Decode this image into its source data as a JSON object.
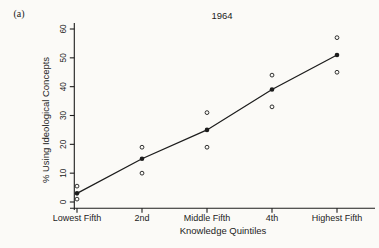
{
  "chart_data": {
    "type": "line",
    "title": "1964",
    "panel_label": "(a)",
    "xlabel": "Knowledge Quintiles",
    "ylabel": "% Using Ideological Concepts",
    "categories": [
      "Lowest Fifth",
      "2nd",
      "Middle Fifth",
      "4th",
      "Highest Fifth"
    ],
    "series": [
      {
        "name": "trend-filled-points",
        "marker": "filled-circle",
        "line": true,
        "values": [
          3,
          15,
          25,
          39,
          51
        ]
      },
      {
        "name": "upper-open-points",
        "marker": "open-circle",
        "line": false,
        "values": [
          5.5,
          19,
          31,
          44,
          57
        ]
      },
      {
        "name": "lower-open-points",
        "marker": "open-circle",
        "line": false,
        "values": [
          1,
          10,
          19,
          33,
          45
        ]
      }
    ],
    "ylim": [
      0,
      60
    ],
    "yticks": [
      0,
      10,
      20,
      30,
      40,
      50,
      60
    ],
    "grid": false,
    "legend": "none",
    "colors": {
      "ink": "#1c1c1c",
      "background": "#fbfaf7"
    }
  }
}
